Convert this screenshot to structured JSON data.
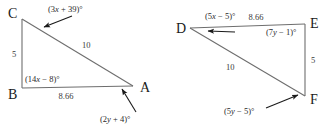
{
  "figure": {
    "type": "geometry-diagram",
    "background_color": "#ffffff",
    "side_stroke_color": "#6e6e6e",
    "leader_stroke_color": "#1a1a1a",
    "triangles": [
      {
        "name": "triangle-abc",
        "vertices": [
          {
            "name": "C",
            "label": "C",
            "x": 22,
            "y": 19
          },
          {
            "name": "B",
            "label": "B",
            "x": 22,
            "y": 88
          },
          {
            "name": "A",
            "label": "A",
            "x": 133,
            "y": 86
          }
        ],
        "sides": [
          {
            "name": "CB",
            "label": "5",
            "from": "C",
            "to": "B"
          },
          {
            "name": "CA",
            "label": "10",
            "from": "C",
            "to": "A"
          },
          {
            "name": "BA",
            "label": "8.66",
            "from": "B",
            "to": "A"
          }
        ],
        "angles": [
          {
            "at": "C",
            "label": "(3x + 39)°",
            "prefix": "(3",
            "var": "x",
            "suffix": " + 39)°",
            "leader": true
          },
          {
            "at": "B",
            "label": "(14x − 8)°",
            "prefix": "(14",
            "var": "x",
            "suffix": " − 8)°",
            "leader": false
          },
          {
            "at": "A",
            "label": "(2y + 4)°",
            "prefix": "(2",
            "var": "y",
            "suffix": " + 4)°",
            "leader": true
          }
        ]
      },
      {
        "name": "triangle-def",
        "vertices": [
          {
            "name": "D",
            "label": "D",
            "x": 190,
            "y": 28
          },
          {
            "name": "E",
            "label": "E",
            "x": 305,
            "y": 24
          },
          {
            "name": "F",
            "label": "F",
            "x": 305,
            "y": 96
          }
        ],
        "sides": [
          {
            "name": "DE",
            "label": "8.66",
            "from": "D",
            "to": "E"
          },
          {
            "name": "EF",
            "label": "5",
            "from": "E",
            "to": "F"
          },
          {
            "name": "DF",
            "label": "10",
            "from": "D",
            "to": "F"
          }
        ],
        "angles": [
          {
            "at": "D",
            "label": "(5x − 5)°",
            "prefix": "(5",
            "var": "x",
            "suffix": " − 5)°",
            "leader": true
          },
          {
            "at": "E",
            "label": "(7y − 1)°",
            "prefix": "(7",
            "var": "y",
            "suffix": " − 1)°",
            "leader": false
          },
          {
            "at": "F",
            "label": "(5y − 5)°",
            "prefix": "(5",
            "var": "y",
            "suffix": " − 5)°",
            "leader": true
          }
        ]
      }
    ],
    "labels": {
      "vertex_c": "C",
      "vertex_b": "B",
      "vertex_a": "A",
      "vertex_d": "D",
      "vertex_e": "E",
      "vertex_f": "F",
      "side_cb": "5",
      "side_ca": "10",
      "side_ba": "8.66",
      "side_de": "8.66",
      "side_ef": "5",
      "side_df": "10"
    },
    "angle_text": {
      "c_prefix": "(3",
      "c_var": "x",
      "c_suffix": " + 39)°",
      "b_prefix": "(14",
      "b_var": "x",
      "b_suffix": " − 8)°",
      "a_prefix": "(2",
      "a_var": "y",
      "a_suffix": " + 4)°",
      "d_prefix": "(5",
      "d_var": "x",
      "d_suffix": " − 5)°",
      "e_prefix": "(7",
      "e_var": "y",
      "e_suffix": " − 1)°",
      "f_prefix": "(5",
      "f_var": "y",
      "f_suffix": " − 5)°"
    }
  }
}
